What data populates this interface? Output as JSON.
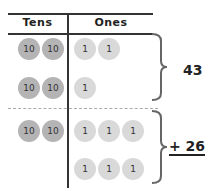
{
  "headers": {
    "tens": "Tens",
    "ones": "Ones"
  },
  "groups": [
    {
      "total": "43",
      "rows": [
        {
          "tens": [
            "10",
            "10"
          ],
          "ones": [
            "1",
            "1"
          ]
        },
        {
          "tens": [
            "10",
            "10"
          ],
          "ones": [
            "1"
          ]
        }
      ]
    },
    {
      "total": "+ 26",
      "rows": [
        {
          "tens": [
            "10",
            "10"
          ],
          "ones": [
            "1",
            "1",
            "1"
          ]
        },
        {
          "tens": [],
          "ones": [
            "1",
            "1",
            "1"
          ]
        }
      ]
    }
  ],
  "colors": {
    "ten_coin": "#b4b4b4",
    "one_coin": "#d9d9d9",
    "lines": "#333333"
  }
}
